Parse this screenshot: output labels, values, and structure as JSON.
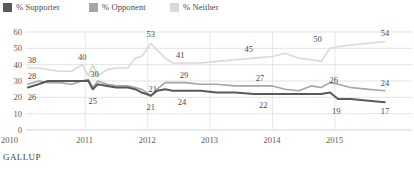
{
  "legend": {
    "items": [
      {
        "label": "% Supporter",
        "color": "#595959",
        "swatch": "legend-swatch-supporter"
      },
      {
        "label": "% Opponent",
        "color": "#a6a6a6",
        "swatch": "legend-swatch-opponent"
      },
      {
        "label": "% Neither",
        "color": "#d9d9d9",
        "swatch": "legend-swatch-neither"
      }
    ]
  },
  "footer": {
    "source": "GALLUP"
  },
  "chart_data": {
    "type": "line",
    "title": "",
    "subtitle": "",
    "xlabel": "",
    "ylabel": "",
    "ylim": [
      0,
      60
    ],
    "yticks": [
      0,
      10,
      20,
      30,
      40,
      50,
      60
    ],
    "ytick_labels": [
      "0",
      "10",
      "20",
      "30",
      "40",
      "50",
      "60"
    ],
    "xticks": [
      2010,
      2011,
      2012,
      2013,
      2014,
      2015
    ],
    "xtick_labels": [
      "2010",
      "2011",
      "2012",
      "2013",
      "2014",
      "2015"
    ],
    "xlim": [
      2010.05,
      2015.85
    ],
    "grid": true,
    "legend_position": "top-left",
    "series": [
      {
        "name": "% Neither",
        "color": "#d9d9d9",
        "x": [
          2010.08,
          2010.25,
          2010.4,
          2010.58,
          2010.78,
          2010.95,
          2011.05,
          2011.12,
          2011.2,
          2011.35,
          2011.5,
          2011.68,
          2011.8,
          2011.9,
          2011.98,
          2012.05,
          2012.15,
          2012.28,
          2012.4,
          2012.6,
          2012.85,
          2013.1,
          2013.4,
          2013.7,
          2014.0,
          2014.2,
          2014.42,
          2014.62,
          2014.78,
          2014.92,
          2015.05,
          2015.25,
          2015.5,
          2015.8
        ],
        "y": [
          38,
          38,
          37,
          36,
          36,
          40,
          33,
          40,
          33,
          37,
          38,
          38,
          44,
          45,
          49,
          53,
          49,
          44,
          41,
          41,
          41,
          42,
          43,
          44,
          45,
          47,
          44,
          43,
          42,
          50,
          51,
          52,
          53,
          54
        ]
      },
      {
        "name": "% Opponent",
        "color": "#a6a6a6",
        "x": [
          2010.08,
          2010.25,
          2010.4,
          2010.58,
          2010.78,
          2010.95,
          2011.05,
          2011.12,
          2011.2,
          2011.35,
          2011.5,
          2011.68,
          2011.8,
          2011.9,
          2011.98,
          2012.05,
          2012.15,
          2012.28,
          2012.4,
          2012.6,
          2012.85,
          2013.1,
          2013.4,
          2013.7,
          2014.0,
          2014.2,
          2014.42,
          2014.62,
          2014.78,
          2014.92,
          2015.05,
          2015.25,
          2015.5,
          2015.8
        ],
        "y": [
          28,
          30,
          29,
          29,
          28,
          30,
          31,
          26,
          30,
          28,
          27,
          27,
          26,
          25,
          23,
          21,
          25,
          29,
          29,
          29,
          28,
          28,
          27,
          27,
          27,
          25,
          24,
          27,
          26,
          29,
          28,
          26,
          25,
          24
        ]
      },
      {
        "name": "% Supporter",
        "color": "#595959",
        "x": [
          2010.08,
          2010.25,
          2010.4,
          2010.58,
          2010.78,
          2010.95,
          2011.05,
          2011.12,
          2011.2,
          2011.35,
          2011.5,
          2011.68,
          2011.8,
          2011.9,
          2011.98,
          2012.05,
          2012.15,
          2012.28,
          2012.4,
          2012.6,
          2012.85,
          2013.1,
          2013.4,
          2013.7,
          2014.0,
          2014.2,
          2014.42,
          2014.62,
          2014.78,
          2014.92,
          2015.05,
          2015.25,
          2015.5,
          2015.8
        ],
        "y": [
          26,
          28,
          30,
          30,
          30,
          30,
          30,
          25,
          28,
          27,
          26,
          26,
          25,
          23,
          22,
          21,
          24,
          25,
          24,
          24,
          24,
          23,
          23,
          22,
          22,
          22,
          22,
          22,
          22,
          23,
          19,
          19,
          18,
          17
        ]
      }
    ],
    "annotations": [
      {
        "text": "38",
        "x": 2010.08,
        "y": 38,
        "dx": 4,
        "dy": -5,
        "series": "% Neither"
      },
      {
        "text": "28",
        "x": 2010.08,
        "y": 28,
        "dx": 4,
        "dy": -5,
        "series": "% Opponent"
      },
      {
        "text": "26",
        "x": 2010.08,
        "y": 26,
        "dx": 4,
        "dy": 12,
        "series": "% Supporter"
      },
      {
        "text": "40",
        "x": 2010.95,
        "y": 40,
        "dx": 0,
        "dy": -5,
        "series": "% Neither"
      },
      {
        "text": "30",
        "x": 2011.1,
        "y": 30,
        "dx": 3,
        "dy": -4,
        "series": "% Opponent"
      },
      {
        "text": "25",
        "x": 2011.12,
        "y": 25,
        "dx": 0,
        "dy": 15,
        "series": "% Supporter"
      },
      {
        "text": "53",
        "x": 2012.05,
        "y": 53,
        "dx": 0,
        "dy": -6,
        "series": "% Neither"
      },
      {
        "text": "21",
        "x": 2012.05,
        "y": 21,
        "dx": 2,
        "dy": -4,
        "series": "% Opponent"
      },
      {
        "text": "21",
        "x": 2012.05,
        "y": 21,
        "dx": 0,
        "dy": 14,
        "series": "% Supporter"
      },
      {
        "text": "41",
        "x": 2012.52,
        "y": 41,
        "dx": 0,
        "dy": -5,
        "series": "% Neither"
      },
      {
        "text": "29",
        "x": 2012.58,
        "y": 29,
        "dx": 0,
        "dy": -5,
        "series": "% Opponent"
      },
      {
        "text": "24",
        "x": 2012.55,
        "y": 24,
        "dx": 0,
        "dy": 14,
        "series": "% Supporter"
      },
      {
        "text": "45",
        "x": 2013.62,
        "y": 45,
        "dx": 0,
        "dy": -5,
        "series": "% Neither"
      },
      {
        "text": "27",
        "x": 2013.8,
        "y": 27,
        "dx": 0,
        "dy": -5,
        "series": "% Opponent"
      },
      {
        "text": "22",
        "x": 2013.85,
        "y": 22,
        "dx": 0,
        "dy": 14,
        "series": "% Supporter"
      },
      {
        "text": "50",
        "x": 2014.72,
        "y": 50,
        "dx": 0,
        "dy": -6,
        "series": "% Neither"
      },
      {
        "text": "26",
        "x": 2014.98,
        "y": 26,
        "dx": 0,
        "dy": -5,
        "series": "% Opponent"
      },
      {
        "text": "19",
        "x": 2015.02,
        "y": 19,
        "dx": 0,
        "dy": 15,
        "series": "% Supporter"
      },
      {
        "text": "54",
        "x": 2015.8,
        "y": 54,
        "dx": 0,
        "dy": -6,
        "series": "% Neither"
      },
      {
        "text": "24",
        "x": 2015.8,
        "y": 24,
        "dx": 0,
        "dy": -5,
        "series": "% Opponent"
      },
      {
        "text": "17",
        "x": 2015.8,
        "y": 17,
        "dx": 0,
        "dy": 12,
        "series": "% Supporter"
      }
    ]
  }
}
